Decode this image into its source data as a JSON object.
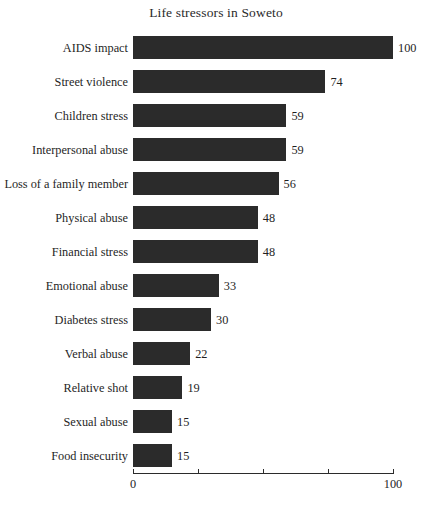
{
  "chart_data": {
    "type": "bar",
    "orientation": "horizontal",
    "title": "Life stressors in Soweto",
    "xlabel": "",
    "ylabel": "",
    "xlim": [
      0,
      100
    ],
    "grid": false,
    "legend": null,
    "bar_color": "#2b2b2b",
    "background_color": "#ffffff",
    "value_labels_shown": true,
    "axis_ticks": [
      {
        "value": 0,
        "label": "0",
        "label_shown": true
      },
      {
        "value": 25,
        "label": "",
        "label_shown": false
      },
      {
        "value": 50,
        "label": "",
        "label_shown": false
      },
      {
        "value": 75,
        "label": "",
        "label_shown": false
      },
      {
        "value": 100,
        "label": "100",
        "label_shown": true
      }
    ],
    "categories": [
      "AIDS impact",
      "Street violence",
      "Children stress",
      "Interpersonal abuse",
      "Loss of a family member",
      "Physical abuse",
      "Financial stress",
      "Emotional abuse",
      "Diabetes stress",
      "Verbal abuse",
      "Relative shot",
      "Sexual abuse",
      "Food insecurity"
    ],
    "values": [
      100,
      74,
      59,
      59,
      56,
      48,
      48,
      33,
      30,
      22,
      19,
      15,
      15
    ],
    "bars": [
      {
        "category": "AIDS impact",
        "value": 100,
        "label": "100"
      },
      {
        "category": "Street violence",
        "value": 74,
        "label": "74"
      },
      {
        "category": "Children stress",
        "value": 59,
        "label": "59"
      },
      {
        "category": "Interpersonal abuse",
        "value": 59,
        "label": "59"
      },
      {
        "category": "Loss of a family member",
        "value": 56,
        "label": "56"
      },
      {
        "category": "Physical abuse",
        "value": 48,
        "label": "48"
      },
      {
        "category": "Financial stress",
        "value": 48,
        "label": "48"
      },
      {
        "category": "Emotional abuse",
        "value": 33,
        "label": "33"
      },
      {
        "category": "Diabetes stress",
        "value": 30,
        "label": "30"
      },
      {
        "category": "Verbal abuse",
        "value": 22,
        "label": "22"
      },
      {
        "category": "Relative shot",
        "value": 19,
        "label": "19"
      },
      {
        "category": "Sexual abuse",
        "value": 15,
        "label": "15"
      },
      {
        "category": "Food insecurity",
        "value": 15,
        "label": "15"
      }
    ]
  }
}
